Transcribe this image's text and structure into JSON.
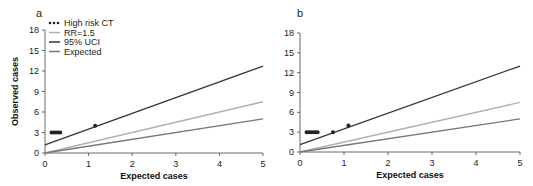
{
  "chart_data": [
    {
      "panel": "a",
      "type": "scatter",
      "xlabel": "Expected cases",
      "ylabel": "Observed cases",
      "xlim": [
        0,
        5
      ],
      "ylim": [
        0,
        18
      ],
      "xticks": [
        0,
        1,
        2,
        3,
        4,
        5
      ],
      "yticks": [
        0,
        3,
        6,
        9,
        12,
        15,
        18
      ],
      "legend": [
        "High risk CT",
        "RR=1.5",
        "95% UCI",
        "Expected"
      ],
      "legend_position": "upper left",
      "grid": false,
      "points": {
        "name": "High risk CT",
        "x": [
          0.15,
          0.2,
          0.25,
          0.3,
          0.35,
          1.15
        ],
        "y": [
          3,
          3,
          3,
          3,
          3,
          4
        ]
      },
      "lines": [
        {
          "name": "RR=1.5",
          "x": [
            0,
            5
          ],
          "y": [
            0,
            7.5
          ],
          "color": "#b0b0b0"
        },
        {
          "name": "95% UCI",
          "x": [
            0,
            5
          ],
          "y": [
            1.2,
            12.7
          ],
          "color": "#333333"
        },
        {
          "name": "Expected",
          "x": [
            0,
            5
          ],
          "y": [
            0,
            5
          ],
          "color": "#777777"
        }
      ]
    },
    {
      "panel": "b",
      "type": "scatter",
      "xlabel": "Expected cases",
      "ylabel": "",
      "xlim": [
        0,
        5
      ],
      "ylim": [
        0,
        18
      ],
      "xticks": [
        0,
        1,
        2,
        3,
        4,
        5
      ],
      "yticks": [
        0,
        3,
        6,
        9,
        12,
        15,
        18
      ],
      "grid": false,
      "points": {
        "name": "High risk CT",
        "x": [
          0.15,
          0.2,
          0.25,
          0.3,
          0.35,
          0.4,
          0.75,
          1.1
        ],
        "y": [
          3,
          3,
          3,
          3,
          3,
          3,
          3,
          4
        ]
      },
      "lines": [
        {
          "name": "RR=1.5",
          "x": [
            0,
            5
          ],
          "y": [
            0,
            7.5
          ],
          "color": "#b0b0b0"
        },
        {
          "name": "95% UCI",
          "x": [
            0,
            5
          ],
          "y": [
            1.1,
            13.0
          ],
          "color": "#333333"
        },
        {
          "name": "Expected",
          "x": [
            0,
            5
          ],
          "y": [
            0,
            5
          ],
          "color": "#777777"
        }
      ]
    }
  ]
}
